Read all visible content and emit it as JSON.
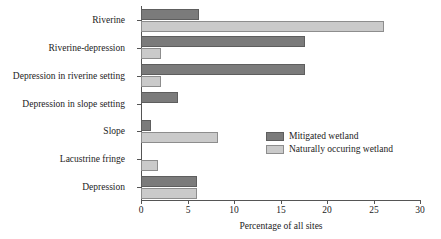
{
  "chart_data": {
    "type": "bar",
    "orientation": "horizontal",
    "title": "",
    "xlabel": "Percentage of all sites",
    "ylabel": "",
    "xlim": [
      0,
      30
    ],
    "xticks": [
      0,
      5,
      10,
      15,
      20,
      25,
      30
    ],
    "xtick_labels": [
      "0",
      "5",
      "10",
      "15",
      "20",
      "25",
      "30"
    ],
    "grid": false,
    "legend_position": "center-right",
    "categories": [
      "Riverine",
      "Riverine-depression",
      "Depression in riverine setting",
      "Depression in slope setting",
      "Slope",
      "Lacustrine fringe",
      "Depression"
    ],
    "series": [
      {
        "name": "Mitigated wetland",
        "color": "#7b7b7b",
        "values": [
          6.2,
          17.6,
          17.6,
          4.0,
          1.1,
          0.0,
          6.0
        ]
      },
      {
        "name": "Naturally occuring wetland",
        "color": "#cacaca",
        "values": [
          26.1,
          2.1,
          2.1,
          0.0,
          8.3,
          1.8,
          6.0
        ]
      }
    ]
  },
  "legend": {
    "items": [
      {
        "label": "Mitigated wetland",
        "swatch": "mitigated"
      },
      {
        "label": "Naturally occuring wetland",
        "swatch": "natural"
      }
    ]
  },
  "colors": {
    "mitigated": "#7b7b7b",
    "natural": "#cacaca",
    "axis": "#555555",
    "text": "#1c1c1c",
    "background": "#ffffff"
  }
}
